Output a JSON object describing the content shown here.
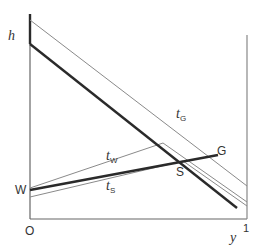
{
  "diagram": {
    "axes": {
      "y_axis_label": "h",
      "x_axis_label": "y",
      "origin_label": "O",
      "x_max_label": "1"
    },
    "points": {
      "W": "W",
      "S": "S",
      "G": "G"
    },
    "curves": {
      "tG": {
        "main": "t",
        "sub": "G"
      },
      "tW": {
        "main": "t",
        "sub": "W"
      },
      "tS": {
        "main": "t",
        "sub": "S"
      }
    },
    "colors": {
      "thick": "#2a2a2a",
      "thin": "#8a8a8a",
      "axis": "#555555"
    }
  }
}
